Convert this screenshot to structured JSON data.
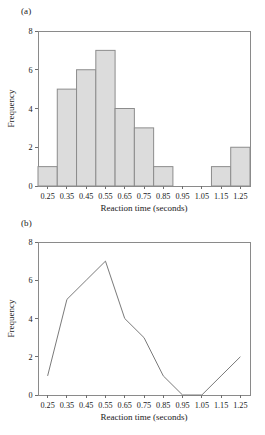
{
  "figure": {
    "panels": [
      {
        "key": "a",
        "label": "(a)"
      },
      {
        "key": "b",
        "label": "(b)"
      }
    ]
  },
  "chart_data": [
    {
      "type": "bar",
      "panel": "(a)",
      "title": "",
      "xlabel": "Reaction time (seconds)",
      "ylabel": "Frequency",
      "categories": [
        "0.25",
        "0.35",
        "0.45",
        "0.55",
        "0.65",
        "0.75",
        "0.85",
        "0.95",
        "1.05",
        "1.15",
        "1.25"
      ],
      "values": [
        1,
        5,
        6,
        7,
        4,
        3,
        1,
        0,
        0,
        1,
        2
      ],
      "x": [
        0.25,
        0.35,
        0.45,
        0.55,
        0.65,
        0.75,
        0.85,
        0.95,
        1.05,
        1.15,
        1.25
      ],
      "xlim": [
        0.2,
        1.3
      ],
      "ylim": [
        0,
        8
      ],
      "yticks": [
        "0",
        "2",
        "4",
        "6",
        "8"
      ],
      "ytick_values": [
        0,
        2,
        4,
        6,
        8
      ],
      "xticks": [
        "0.25",
        "0.35",
        "0.45",
        "0.55",
        "0.65",
        "0.75",
        "0.85",
        "0.95",
        "1.05",
        "1.15",
        "1.25"
      ],
      "bar_width": 0.1,
      "bar_fill": "#dcdcdc",
      "bar_border": "#8c8c8c",
      "grid": false,
      "legend": "none"
    },
    {
      "type": "line",
      "panel": "(b)",
      "title": "",
      "xlabel": "Reaction time (seconds)",
      "ylabel": "Frequency",
      "categories": [
        "0.25",
        "0.35",
        "0.45",
        "0.55",
        "0.65",
        "0.75",
        "0.85",
        "0.95",
        "1.05",
        "1.15",
        "1.25"
      ],
      "x": [
        0.25,
        0.35,
        0.45,
        0.55,
        0.65,
        0.75,
        0.85,
        0.95,
        1.05,
        1.15,
        1.25
      ],
      "values": [
        1,
        5,
        6,
        7,
        4,
        3,
        1,
        0,
        0,
        1,
        2
      ],
      "series": [
        {
          "name": "Frequency polygon",
          "values": [
            1,
            5,
            6,
            7,
            4,
            3,
            1,
            0,
            0,
            1,
            2
          ]
        }
      ],
      "xlim": [
        0.2,
        1.3
      ],
      "ylim": [
        0,
        8
      ],
      "yticks": [
        "0",
        "2",
        "4",
        "6",
        "8"
      ],
      "ytick_values": [
        0,
        2,
        4,
        6,
        8
      ],
      "xticks": [
        "0.25",
        "0.35",
        "0.45",
        "0.55",
        "0.65",
        "0.75",
        "0.85",
        "0.95",
        "1.05",
        "1.15",
        "1.25"
      ],
      "line_color": "#7a7a7a",
      "markers": false,
      "grid": false,
      "legend": "none"
    }
  ]
}
